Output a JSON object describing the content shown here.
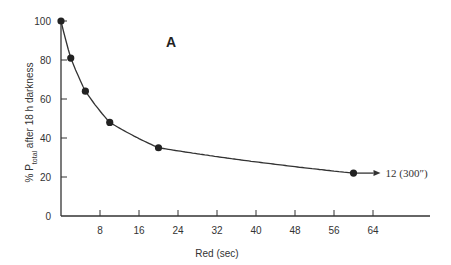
{
  "chart_data": {
    "type": "line",
    "title": "",
    "panel_label": "A",
    "xlabel": "Red (sec)",
    "ylabel": "% P_total after 18 h darkness",
    "ylabel_parts": {
      "prefix": "% P",
      "subscript": "total",
      "suffix": " after 18 h darkness"
    },
    "xlim": [
      0,
      72
    ],
    "ylim": [
      0,
      100
    ],
    "x_ticks": [
      8,
      16,
      24,
      32,
      40,
      48,
      56,
      64
    ],
    "y_ticks": [
      0,
      20,
      40,
      60,
      80,
      100
    ],
    "grid": false,
    "legend": null,
    "series": [
      {
        "name": "P_total",
        "x": [
          0,
          2,
          5,
          10,
          20,
          60
        ],
        "y": [
          100,
          81,
          64,
          48,
          35,
          22
        ],
        "marker": "filled-circle",
        "fit_curve": "smooth decay"
      }
    ],
    "annotations": [
      {
        "text": "12 (300″)",
        "at": {
          "x": 60,
          "y": 22
        },
        "arrow": "right"
      }
    ]
  }
}
